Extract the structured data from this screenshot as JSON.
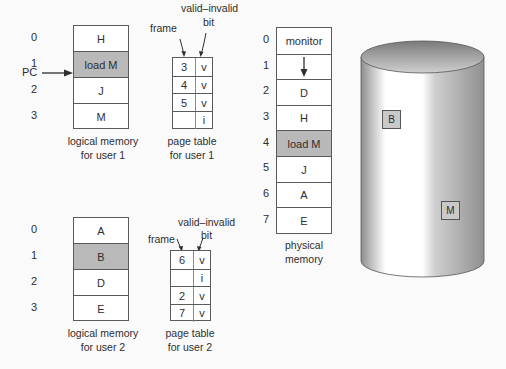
{
  "colors": {
    "shaded": "#b9b9b9",
    "border": "#5a5a5a",
    "text": "#2e2e2e",
    "disk_box": "#c9c9c9"
  },
  "pc_label": "PC",
  "user1": {
    "logical_memory": {
      "indices": [
        "0",
        "1",
        "2",
        "3"
      ],
      "cells": [
        "H",
        "load M",
        "J",
        "M"
      ],
      "shaded_index": 1,
      "caption_line1": "logical memory",
      "caption_line2": "for user 1"
    },
    "page_table": {
      "frame_label": "frame",
      "valid_label_line1": "valid–invalid",
      "valid_label_line2": "bit",
      "rows": [
        {
          "frame": "3",
          "bit": "v"
        },
        {
          "frame": "4",
          "bit": "v"
        },
        {
          "frame": "5",
          "bit": "v"
        },
        {
          "frame": "",
          "bit": "i"
        }
      ],
      "caption_line1": "page table",
      "caption_line2": "for user 1"
    }
  },
  "user2": {
    "logical_memory": {
      "indices": [
        "0",
        "1",
        "2",
        "3"
      ],
      "cells": [
        "A",
        "B",
        "D",
        "E"
      ],
      "shaded_index": 1,
      "caption_line1": "logical memory",
      "caption_line2": "for user 2"
    },
    "page_table": {
      "frame_label": "frame",
      "valid_label_line1": "valid–invalid",
      "valid_label_line2": "bit",
      "rows": [
        {
          "frame": "6",
          "bit": "v"
        },
        {
          "frame": "",
          "bit": "i"
        },
        {
          "frame": "2",
          "bit": "v"
        },
        {
          "frame": "7",
          "bit": "v"
        }
      ],
      "caption_line1": "page table",
      "caption_line2": "for user 2"
    }
  },
  "physical_memory": {
    "indices": [
      "0",
      "1",
      "2",
      "3",
      "4",
      "5",
      "6",
      "7"
    ],
    "cells": [
      "monitor",
      "",
      "D",
      "H",
      "load M",
      "J",
      "A",
      "E"
    ],
    "shaded_index": 4,
    "caption_line1": "physical",
    "caption_line2": "memory"
  },
  "disk": {
    "items": [
      {
        "label": "B"
      },
      {
        "label": "M"
      }
    ]
  }
}
